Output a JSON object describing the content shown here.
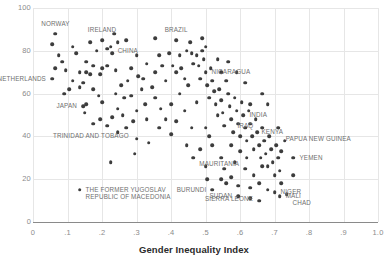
{
  "chart_data": {
    "type": "scatter",
    "title": "",
    "xlabel": "Gender Inequality Index",
    "ylabel": "",
    "xlim": [
      0,
      1.0
    ],
    "ylim": [
      0,
      100
    ],
    "grid": true,
    "legend": "none",
    "xticks": [
      "0",
      ".1",
      ".2",
      ".3",
      ".4",
      ".5",
      ".6",
      ".7",
      ".8",
      ".9",
      "1.0"
    ],
    "xtick_values": [
      0,
      0.1,
      0.2,
      0.3,
      0.4,
      0.5,
      0.6,
      0.7,
      0.8,
      0.9,
      1.0
    ],
    "yticks": [
      "0",
      "20",
      "40",
      "60",
      "80",
      "100"
    ],
    "ytick_values": [
      0,
      20,
      40,
      60,
      80,
      100
    ],
    "point_color": "#3c3c3c",
    "grid_color": "#e6e6e6",
    "axis_color": "#8a8a8a",
    "tick_label_color": "#8b8b8b",
    "annotation_color": "#6f6f6f",
    "points": [
      [
        0.065,
        88
      ],
      [
        0.055,
        83
      ],
      [
        0.2,
        85
      ],
      [
        0.215,
        81
      ],
      [
        0.225,
        82
      ],
      [
        0.27,
        85
      ],
      [
        0.125,
        79
      ],
      [
        0.185,
        80
      ],
      [
        0.23,
        79
      ],
      [
        0.085,
        75
      ],
      [
        0.155,
        75
      ],
      [
        0.175,
        73
      ],
      [
        0.2,
        72
      ],
      [
        0.215,
        73
      ],
      [
        0.095,
        71
      ],
      [
        0.135,
        70
      ],
      [
        0.155,
        70
      ],
      [
        0.165,
        69
      ],
      [
        0.195,
        69
      ],
      [
        0.055,
        67
      ],
      [
        0.115,
        66
      ],
      [
        0.145,
        65
      ],
      [
        0.105,
        62
      ],
      [
        0.135,
        63
      ],
      [
        0.09,
        60
      ],
      [
        0.175,
        62
      ],
      [
        0.19,
        59
      ],
      [
        0.2,
        56
      ],
      [
        0.155,
        55
      ],
      [
        0.145,
        54
      ],
      [
        0.15,
        51
      ],
      [
        0.195,
        48
      ],
      [
        0.23,
        49
      ],
      [
        0.175,
        46
      ],
      [
        0.215,
        45
      ],
      [
        0.245,
        53
      ],
      [
        0.265,
        58
      ],
      [
        0.275,
        66
      ],
      [
        0.285,
        72
      ],
      [
        0.3,
        78
      ],
      [
        0.305,
        68
      ],
      [
        0.315,
        62
      ],
      [
        0.325,
        55
      ],
      [
        0.29,
        47
      ],
      [
        0.3,
        52
      ],
      [
        0.33,
        48
      ],
      [
        0.345,
        63
      ],
      [
        0.355,
        70
      ],
      [
        0.365,
        78
      ],
      [
        0.375,
        73
      ],
      [
        0.355,
        58
      ],
      [
        0.37,
        53
      ],
      [
        0.385,
        66
      ],
      [
        0.395,
        79
      ],
      [
        0.405,
        73
      ],
      [
        0.415,
        70
      ],
      [
        0.425,
        78
      ],
      [
        0.43,
        72
      ],
      [
        0.44,
        67
      ],
      [
        0.445,
        80
      ],
      [
        0.455,
        84
      ],
      [
        0.46,
        79
      ],
      [
        0.465,
        74
      ],
      [
        0.475,
        78
      ],
      [
        0.48,
        73
      ],
      [
        0.485,
        67
      ],
      [
        0.49,
        80
      ],
      [
        0.495,
        76
      ],
      [
        0.5,
        70
      ],
      [
        0.505,
        64
      ],
      [
        0.51,
        58
      ],
      [
        0.515,
        72
      ],
      [
        0.52,
        66
      ],
      [
        0.525,
        61
      ],
      [
        0.53,
        55
      ],
      [
        0.535,
        50
      ],
      [
        0.54,
        62
      ],
      [
        0.545,
        57
      ],
      [
        0.55,
        51
      ],
      [
        0.555,
        45
      ],
      [
        0.56,
        66
      ],
      [
        0.565,
        60
      ],
      [
        0.57,
        54
      ],
      [
        0.575,
        48
      ],
      [
        0.58,
        42
      ],
      [
        0.585,
        58
      ],
      [
        0.59,
        52
      ],
      [
        0.595,
        46
      ],
      [
        0.6,
        40
      ],
      [
        0.605,
        56
      ],
      [
        0.61,
        50
      ],
      [
        0.615,
        44
      ],
      [
        0.62,
        38
      ],
      [
        0.625,
        52
      ],
      [
        0.63,
        46
      ],
      [
        0.635,
        40
      ],
      [
        0.64,
        34
      ],
      [
        0.645,
        48
      ],
      [
        0.65,
        42
      ],
      [
        0.655,
        36
      ],
      [
        0.66,
        30
      ],
      [
        0.665,
        44
      ],
      [
        0.67,
        38
      ],
      [
        0.675,
        32
      ],
      [
        0.68,
        26
      ],
      [
        0.685,
        40
      ],
      [
        0.69,
        34
      ],
      [
        0.695,
        28
      ],
      [
        0.7,
        22
      ],
      [
        0.705,
        36
      ],
      [
        0.71,
        30
      ],
      [
        0.715,
        24
      ],
      [
        0.72,
        18
      ],
      [
        0.755,
        30
      ],
      [
        0.7,
        14
      ],
      [
        0.715,
        12
      ],
      [
        0.735,
        13
      ],
      [
        0.68,
        15
      ],
      [
        0.63,
        16
      ],
      [
        0.595,
        17
      ],
      [
        0.56,
        18
      ],
      [
        0.52,
        15
      ],
      [
        0.595,
        12
      ],
      [
        0.63,
        11
      ],
      [
        0.655,
        10
      ],
      [
        0.135,
        15
      ],
      [
        0.225,
        28
      ],
      [
        0.295,
        32
      ],
      [
        0.3,
        39
      ],
      [
        0.335,
        37
      ],
      [
        0.445,
        36
      ],
      [
        0.4,
        41
      ],
      [
        0.46,
        44
      ],
      [
        0.415,
        47
      ],
      [
        0.44,
        52
      ],
      [
        0.475,
        56
      ],
      [
        0.5,
        44
      ],
      [
        0.51,
        40
      ],
      [
        0.52,
        36
      ],
      [
        0.485,
        34
      ],
      [
        0.465,
        30
      ],
      [
        0.5,
        26
      ],
      [
        0.545,
        30
      ],
      [
        0.555,
        25
      ],
      [
        0.585,
        28
      ],
      [
        0.615,
        25
      ],
      [
        0.64,
        22
      ],
      [
        0.655,
        18
      ],
      [
        0.575,
        21
      ],
      [
        0.545,
        20
      ],
      [
        0.505,
        20
      ],
      [
        0.62,
        30
      ],
      [
        0.665,
        26
      ],
      [
        0.5,
        82
      ],
      [
        0.49,
        86
      ],
      [
        0.415,
        85
      ],
      [
        0.355,
        86
      ],
      [
        0.235,
        88
      ],
      [
        0.245,
        84
      ],
      [
        0.165,
        84
      ],
      [
        0.115,
        82
      ],
      [
        0.075,
        78
      ],
      [
        0.065,
        72
      ],
      [
        0.24,
        71
      ],
      [
        0.255,
        64
      ],
      [
        0.285,
        59
      ],
      [
        0.32,
        67
      ],
      [
        0.33,
        74
      ],
      [
        0.24,
        60
      ],
      [
        0.26,
        50
      ],
      [
        0.27,
        44
      ],
      [
        0.245,
        42
      ],
      [
        0.365,
        44
      ],
      [
        0.385,
        48
      ],
      [
        0.4,
        55
      ],
      [
        0.425,
        60
      ],
      [
        0.45,
        64
      ],
      [
        0.535,
        76
      ],
      [
        0.545,
        70
      ],
      [
        0.565,
        75
      ],
      [
        0.59,
        70
      ],
      [
        0.615,
        65
      ],
      [
        0.575,
        36
      ],
      [
        0.6,
        33
      ],
      [
        0.665,
        60
      ],
      [
        0.68,
        55
      ],
      [
        0.71,
        44
      ],
      [
        0.73,
        38
      ],
      [
        0.755,
        22
      ],
      [
        0.72,
        33
      ],
      [
        0.63,
        55
      ]
    ],
    "annotations": [
      {
        "name": "NORWAY",
        "x": 0.065,
        "y": 88,
        "dx": 0,
        "dy": -10,
        "align": "center"
      },
      {
        "name": "IRELAND",
        "x": 0.2,
        "y": 85,
        "dx": 0,
        "dy": -10,
        "align": "center"
      },
      {
        "name": "CHINA",
        "x": 0.225,
        "y": 82,
        "dx": 7,
        "dy": 4,
        "align": "left"
      },
      {
        "name": "BRAZIL",
        "x": 0.415,
        "y": 85,
        "dx": 0,
        "dy": -10,
        "align": "center"
      },
      {
        "name": "NICARAGUA",
        "x": 0.5,
        "y": 70,
        "dx": 6,
        "dy": 0,
        "align": "left"
      },
      {
        "name": "NETHERLANDS",
        "x": 0.055,
        "y": 67,
        "dx": -6,
        "dy": 0,
        "align": "right"
      },
      {
        "name": "JAPAN",
        "x": 0.145,
        "y": 54,
        "dx": -6,
        "dy": 0,
        "align": "right"
      },
      {
        "name": "INDIA",
        "x": 0.61,
        "y": 50,
        "dx": 6,
        "dy": 0,
        "align": "left"
      },
      {
        "name": "IRAQ",
        "x": 0.575,
        "y": 45,
        "dx": 6,
        "dy": 0,
        "align": "left"
      },
      {
        "name": "KENYA",
        "x": 0.645,
        "y": 42,
        "dx": 6,
        "dy": 0,
        "align": "left"
      },
      {
        "name": "TRINIDAD AND TOBAGO",
        "x": 0.295,
        "y": 40,
        "dx": -6,
        "dy": 0,
        "align": "right"
      },
      {
        "name": "PAPUA NEW GUINEA",
        "x": 0.715,
        "y": 36,
        "dx": 6,
        "dy": -6,
        "align": "left"
      },
      {
        "name": "YEMEN",
        "x": 0.755,
        "y": 30,
        "dx": 6,
        "dy": 0,
        "align": "left"
      },
      {
        "name": "THE FORMER YUGOSLAV\nREPUBLIC OF MACEDONIA",
        "x": 0.135,
        "y": 15,
        "dx": 6,
        "dy": 0,
        "align": "left"
      },
      {
        "name": "MAURITANIA",
        "x": 0.615,
        "y": 25,
        "dx": -6,
        "dy": -5,
        "align": "right"
      },
      {
        "name": "BURUNDI",
        "x": 0.52,
        "y": 15,
        "dx": -6,
        "dy": 0,
        "align": "right"
      },
      {
        "name": "SUDAN",
        "x": 0.595,
        "y": 12,
        "dx": -6,
        "dy": 0,
        "align": "right"
      },
      {
        "name": "SIERRA LEONE",
        "x": 0.655,
        "y": 10,
        "dx": -6,
        "dy": -2,
        "align": "right"
      },
      {
        "name": "NIGER",
        "x": 0.7,
        "y": 14,
        "dx": 6,
        "dy": 0,
        "align": "left"
      },
      {
        "name": "MALI",
        "x": 0.715,
        "y": 12,
        "dx": 6,
        "dy": 0,
        "align": "left"
      },
      {
        "name": "CHAD",
        "x": 0.735,
        "y": 9,
        "dx": 6,
        "dy": 0,
        "align": "left"
      }
    ]
  }
}
